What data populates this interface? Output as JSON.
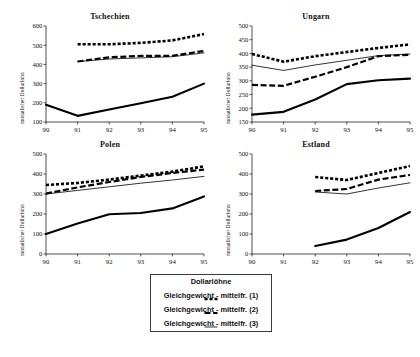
{
  "figure": {
    "top_note": "",
    "ylabel": "monatlicher Dollarlohn",
    "xticks": [
      "90",
      "91",
      "92",
      "93",
      "94",
      "95"
    ]
  },
  "legend": {
    "title": "Dollarlöhne",
    "items": [
      {
        "label": "Gleichgewicht - mittelfr. (1)",
        "style": "dotted-thick"
      },
      {
        "label": "Gleichgewicht - mittelfr. (2)",
        "style": "dashed-thick"
      },
      {
        "label": "Gleichgewicht - mittelfr. (3)",
        "style": "solid-thin"
      }
    ]
  },
  "chart_data": [
    {
      "type": "line",
      "title": "Tschechien",
      "xlabel": "",
      "ylabel": "monatlicher Dollarlohn",
      "x": [
        90,
        91,
        92,
        93,
        94,
        95
      ],
      "xlim": [
        90,
        95
      ],
      "ylim": [
        100,
        600
      ],
      "yticks": [
        100,
        200,
        300,
        400,
        500,
        600
      ],
      "xticks": [
        90,
        91,
        92,
        93,
        94,
        95
      ],
      "grid": false,
      "series": [
        {
          "name": "Dollarlöhne",
          "style": "solid-thick",
          "x": [
            90,
            91,
            92,
            93,
            94,
            95
          ],
          "values": [
            190,
            132,
            165,
            198,
            232,
            300
          ]
        },
        {
          "name": "Gleichgewicht - mittelfr. (1)",
          "style": "dotted-thick",
          "x": [
            91,
            92,
            93,
            94,
            95
          ],
          "values": [
            505,
            505,
            512,
            525,
            558
          ]
        },
        {
          "name": "Gleichgewicht - mittelfr. (2)",
          "style": "dashed-thick",
          "x": [
            91,
            92,
            93,
            94,
            95
          ],
          "values": [
            415,
            437,
            444,
            445,
            470
          ]
        },
        {
          "name": "Gleichgewicht - mittelfr. (3)",
          "style": "solid-thin",
          "x": [
            91,
            92,
            93,
            94,
            95
          ],
          "values": [
            415,
            428,
            434,
            440,
            460
          ]
        }
      ]
    },
    {
      "type": "line",
      "title": "Ungarn",
      "xlabel": "",
      "ylabel": "monatlicher Dollarlohn",
      "x": [
        90,
        91,
        92,
        93,
        94,
        95
      ],
      "xlim": [
        90,
        95
      ],
      "ylim": [
        150,
        500
      ],
      "yticks": [
        150,
        200,
        250,
        300,
        350,
        400,
        450,
        500
      ],
      "xticks": [
        90,
        91,
        92,
        93,
        94,
        95
      ],
      "grid": false,
      "series": [
        {
          "name": "Dollarlöhne",
          "style": "solid-thick",
          "x": [
            90,
            91,
            92,
            93,
            94,
            95
          ],
          "values": [
            177,
            187,
            232,
            288,
            302,
            308
          ]
        },
        {
          "name": "Gleichgewicht - mittelfr. (1)",
          "style": "dotted-thick",
          "x": [
            90,
            91,
            92,
            93,
            94,
            95
          ],
          "values": [
            398,
            370,
            390,
            405,
            420,
            433
          ]
        },
        {
          "name": "Gleichgewicht - mittelfr. (2)",
          "style": "dashed-thick",
          "x": [
            90,
            91,
            92,
            93,
            94,
            95
          ],
          "values": [
            285,
            282,
            315,
            350,
            390,
            395
          ]
        },
        {
          "name": "Gleichgewicht - mittelfr. (3)",
          "style": "solid-thin",
          "x": [
            90,
            91,
            92,
            93,
            94,
            95
          ],
          "values": [
            357,
            338,
            358,
            375,
            392,
            398
          ]
        }
      ]
    },
    {
      "type": "line",
      "title": "Polen",
      "xlabel": "",
      "ylabel": "monatlicher Dollarlohn",
      "x": [
        90,
        91,
        92,
        93,
        94,
        95
      ],
      "xlim": [
        90,
        95
      ],
      "ylim": [
        0,
        500
      ],
      "yticks": [
        0,
        100,
        200,
        300,
        400,
        500
      ],
      "xticks": [
        90,
        91,
        92,
        93,
        94,
        95
      ],
      "grid": false,
      "series": [
        {
          "name": "Dollarlöhne",
          "style": "solid-thick",
          "x": [
            90,
            91,
            92,
            93,
            94,
            95
          ],
          "values": [
            100,
            152,
            199,
            205,
            228,
            288
          ]
        },
        {
          "name": "Gleichgewicht - mittelfr. (1)",
          "style": "dotted-thick",
          "x": [
            90,
            91,
            92,
            93,
            94,
            95
          ],
          "values": [
            345,
            355,
            372,
            392,
            412,
            438
          ]
        },
        {
          "name": "Gleichgewicht - mittelfr. (2)",
          "style": "dashed-thick",
          "x": [
            90,
            91,
            92,
            93,
            94,
            95
          ],
          "values": [
            302,
            333,
            360,
            385,
            405,
            422
          ]
        },
        {
          "name": "Gleichgewicht - mittelfr. (3)",
          "style": "solid-thin",
          "x": [
            90,
            91,
            92,
            93,
            94,
            95
          ],
          "values": [
            300,
            318,
            336,
            354,
            370,
            388
          ]
        }
      ]
    },
    {
      "type": "line",
      "title": "Estland",
      "xlabel": "",
      "ylabel": "monatlicher Dollarlohn",
      "x": [
        90,
        91,
        92,
        93,
        94,
        95
      ],
      "xlim": [
        90,
        95
      ],
      "ylim": [
        0,
        500
      ],
      "yticks": [
        0,
        100,
        200,
        300,
        400,
        500
      ],
      "xticks": [
        90,
        91,
        92,
        93,
        94,
        95
      ],
      "grid": false,
      "series": [
        {
          "name": "Dollarlöhne",
          "style": "solid-thick",
          "x": [
            92,
            93,
            94,
            95
          ],
          "values": [
            40,
            72,
            130,
            210
          ]
        },
        {
          "name": "Gleichgewicht - mittelfr. (1)",
          "style": "dotted-thick",
          "x": [
            92,
            93,
            94,
            95
          ],
          "values": [
            385,
            370,
            405,
            440
          ]
        },
        {
          "name": "Gleichgewicht - mittelfr. (2)",
          "style": "dashed-thick",
          "x": [
            92,
            93,
            94,
            95
          ],
          "values": [
            315,
            325,
            372,
            395
          ]
        },
        {
          "name": "Gleichgewicht - mittelfr. (3)",
          "style": "solid-thin",
          "x": [
            92,
            93,
            94,
            95
          ],
          "values": [
            310,
            300,
            330,
            356
          ]
        }
      ]
    }
  ]
}
